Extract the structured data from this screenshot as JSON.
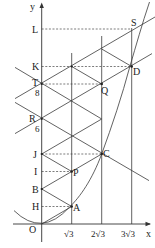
{
  "diagram": {
    "axes": {
      "x_label": "x",
      "y_label": "y",
      "origin_label": "O"
    },
    "x_ticks": [
      "√3",
      "2√3",
      "3√3"
    ],
    "y_axis_points": [
      {
        "label": "H",
        "value": 1
      },
      {
        "label": "B",
        "value": 2
      },
      {
        "label": "I",
        "value": 3
      },
      {
        "label": "J",
        "value": 4
      },
      {
        "label": "R",
        "value": 6,
        "sub": "6"
      },
      {
        "label": "T",
        "value": 8,
        "sub": "8"
      },
      {
        "label": "K",
        "value": 9
      },
      {
        "label": "L",
        "value": 11
      }
    ],
    "curve_points": [
      {
        "label": "A",
        "x": "√3",
        "y": 1
      },
      {
        "label": "P",
        "x": "√3",
        "y": 3
      },
      {
        "label": "C",
        "x": "2√3",
        "y": 4
      },
      {
        "label": "Q",
        "x": "2√3",
        "y": 8
      },
      {
        "label": "D",
        "x": "3√3",
        "y": 9
      },
      {
        "label": "S"
      }
    ],
    "curve": "y = x²/3"
  }
}
